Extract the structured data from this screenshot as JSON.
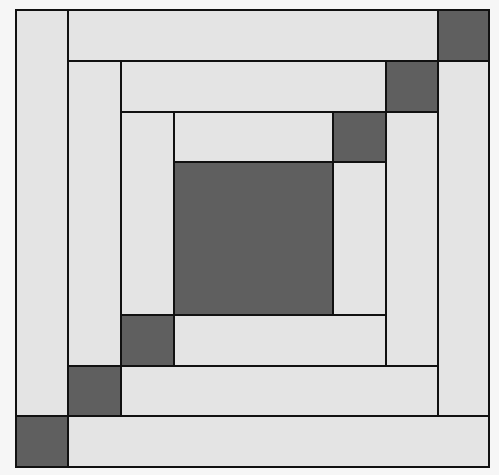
{
  "diagram": {
    "title": "",
    "type": "quilt-block",
    "colors": {
      "background": "#f6f6f6",
      "light_fabric": "#e4e4e4",
      "dark_fabric": "#5f5f5f",
      "seam_line": "#111111"
    },
    "pieces": [
      {
        "id": "center",
        "tone": "dark",
        "x1": 174,
        "y1": 162,
        "x2": 333,
        "y2": 315
      },
      {
        "id": "ring1-top",
        "tone": "light",
        "x1": 174,
        "y1": 112,
        "x2": 333,
        "y2": 162
      },
      {
        "id": "ring1-top-right-square",
        "tone": "dark",
        "x1": 333,
        "y1": 112,
        "x2": 386,
        "y2": 162
      },
      {
        "id": "ring1-right",
        "tone": "light",
        "x1": 333,
        "y1": 162,
        "x2": 386,
        "y2": 366
      },
      {
        "id": "ring1-bottom",
        "tone": "light",
        "x1": 174,
        "y1": 315,
        "x2": 386,
        "y2": 366
      },
      {
        "id": "ring1-bottom-left-square",
        "tone": "dark",
        "x1": 121,
        "y1": 315,
        "x2": 174,
        "y2": 366
      },
      {
        "id": "ring1-left",
        "tone": "light",
        "x1": 121,
        "y1": 112,
        "x2": 174,
        "y2": 315
      },
      {
        "id": "ring2-top",
        "tone": "light",
        "x1": 121,
        "y1": 61,
        "x2": 386,
        "y2": 112
      },
      {
        "id": "ring2-top-right-square",
        "tone": "dark",
        "x1": 386,
        "y1": 61,
        "x2": 438,
        "y2": 112
      },
      {
        "id": "ring2-right",
        "tone": "light",
        "x1": 386,
        "y1": 112,
        "x2": 438,
        "y2": 416
      },
      {
        "id": "ring2-bottom",
        "tone": "light",
        "x1": 121,
        "y1": 366,
        "x2": 438,
        "y2": 416
      },
      {
        "id": "ring2-bottom-left-square",
        "tone": "dark",
        "x1": 68,
        "y1": 366,
        "x2": 121,
        "y2": 416
      },
      {
        "id": "ring2-left",
        "tone": "light",
        "x1": 68,
        "y1": 61,
        "x2": 121,
        "y2": 366
      },
      {
        "id": "ring3-top",
        "tone": "light",
        "x1": 68,
        "y1": 10,
        "x2": 438,
        "y2": 61
      },
      {
        "id": "ring3-top-right-square",
        "tone": "dark",
        "x1": 438,
        "y1": 10,
        "x2": 489,
        "y2": 61
      },
      {
        "id": "ring3-right",
        "tone": "light",
        "x1": 438,
        "y1": 61,
        "x2": 489,
        "y2": 467
      },
      {
        "id": "ring3-bottom",
        "tone": "light",
        "x1": 68,
        "y1": 416,
        "x2": 489,
        "y2": 467
      },
      {
        "id": "ring3-bottom-left-square",
        "tone": "dark",
        "x1": 16,
        "y1": 416,
        "x2": 68,
        "y2": 467
      },
      {
        "id": "ring3-left",
        "tone": "light",
        "x1": 16,
        "y1": 10,
        "x2": 68,
        "y2": 416
      }
    ]
  }
}
